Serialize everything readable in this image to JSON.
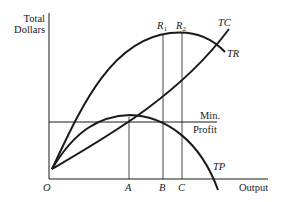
{
  "diagram": {
    "y_axis_label_line1": "Total",
    "y_axis_label_line2": "Dollars",
    "x_axis_label": "Output",
    "origin_label": "O",
    "curves": {
      "tc": "TC",
      "tr": "TR",
      "tp": "TP"
    },
    "min_profit_line1": "Min.",
    "min_profit_line2": "Profit",
    "x_markers": [
      "A",
      "B",
      "C"
    ],
    "r_markers": {
      "r1_base": "R",
      "r1_sub": "1",
      "r2_base": "R",
      "r2_sub": "2"
    },
    "colors": {
      "ink": "#1a1a1a",
      "background": "#ffffff"
    }
  }
}
